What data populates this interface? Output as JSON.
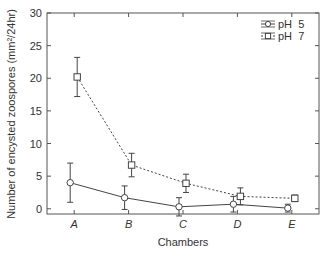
{
  "chart_data": {
    "type": "line",
    "title": "",
    "xlabel": "Chambers",
    "ylabel": "Number of encysted zoospores (mm²/24hr)",
    "categories": [
      "A",
      "B",
      "C",
      "D",
      "E"
    ],
    "ylim": [
      -0.8,
      30
    ],
    "yticks": [
      0,
      5,
      10,
      15,
      20,
      25,
      30
    ],
    "grid": false,
    "legend_position": "upper right",
    "series": [
      {
        "name": "pH  5",
        "line_style": "solid",
        "marker": "circle",
        "values": [
          4.0,
          1.7,
          0.3,
          0.7,
          0.1
        ],
        "errors": [
          3.0,
          1.8,
          1.4,
          1.2,
          0.6
        ],
        "dodge": -4
      },
      {
        "name": "pH  7",
        "line_style": "dashed",
        "marker": "square",
        "values": [
          20.2,
          6.7,
          3.9,
          1.9,
          1.6
        ],
        "errors": [
          3.0,
          1.8,
          1.4,
          1.3,
          0.5
        ],
        "dodge": 3
      }
    ]
  },
  "colors": {
    "axis": "#555555",
    "line": "#444444",
    "text": "#333333"
  }
}
